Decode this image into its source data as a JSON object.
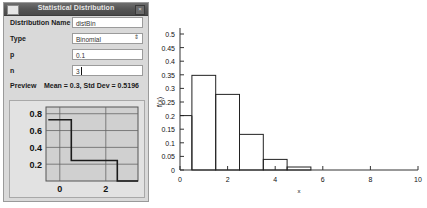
{
  "dialog": {
    "title": "Statistical Distribution",
    "window_icon": "window-restore-icon",
    "close_label": "×",
    "fields": [
      {
        "label": "Distribution Name",
        "value": "distBin",
        "placeholder": "Distribution Name",
        "type": "text"
      },
      {
        "label": "Type",
        "value": "Binomial",
        "placeholder": "Type",
        "type": "select"
      },
      {
        "label": "p",
        "value": "0.1",
        "placeholder": "p",
        "type": "text"
      },
      {
        "label": "n",
        "value": "3",
        "placeholder": "n",
        "type": "text"
      }
    ],
    "type_options": [
      "Binomial"
    ],
    "preview": {
      "label": "Preview",
      "stats": "Mean = 0.3, Std Dev = 0.5196"
    }
  },
  "chart_data": [
    {
      "id": "preview-step-chart",
      "type": "line",
      "title": "",
      "xlabel": "",
      "ylabel": "",
      "xlim": [
        -0.6,
        3.4
      ],
      "ylim": [
        0,
        0.88
      ],
      "xticks": [
        0,
        2
      ],
      "xticklabels": [
        "0",
        "2"
      ],
      "yticks": [
        0.2,
        0.4,
        0.6,
        0.8
      ],
      "yticklabels": [
        "0.2",
        "0.4",
        "0.6",
        "0.8"
      ],
      "grid": true,
      "legend": "none",
      "step_points": [
        {
          "x": -0.5,
          "y": 0.729
        },
        {
          "x": 0.5,
          "y": 0.729
        },
        {
          "x": 0.5,
          "y": 0.243
        },
        {
          "x": 2.5,
          "y": 0.243
        },
        {
          "x": 2.5,
          "y": 0.0
        },
        {
          "x": 3.4,
          "y": 0.0
        }
      ]
    },
    {
      "id": "main-histogram",
      "type": "bar",
      "title": "",
      "xlabel": "x",
      "ylabel": "f(x)",
      "xlim": [
        0,
        10
      ],
      "ylim": [
        0,
        0.5
      ],
      "xticks": [
        0,
        2,
        4,
        6,
        8,
        10
      ],
      "xticklabels": [
        "0",
        "2",
        "4",
        "6",
        "8",
        "10"
      ],
      "yticks": [
        0,
        0.05,
        0.1,
        0.15,
        0.2,
        0.25,
        0.3,
        0.35,
        0.4,
        0.45,
        0.5
      ],
      "yticklabels": [
        "0",
        "0.05",
        "0.1",
        "0.15",
        "0.2",
        "0.25",
        "0.3",
        "0.35",
        "0.4",
        "0.45",
        "0.5"
      ],
      "grid": false,
      "legend": "none",
      "bin_width": 1,
      "categories": [
        "0",
        "1",
        "2",
        "3",
        "4",
        "5"
      ],
      "x": [
        0,
        1,
        2,
        3,
        4,
        5
      ],
      "values": [
        0.2,
        0.348,
        0.278,
        0.131,
        0.039,
        0.011
      ]
    }
  ]
}
